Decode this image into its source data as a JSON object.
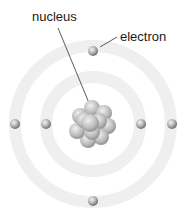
{
  "diagram": {
    "labels": {
      "nucleus": "nucleus",
      "electron": "electron"
    },
    "nucleus": {
      "cx": 93,
      "cy": 124
    },
    "orbits": [
      {
        "name": "inner",
        "radius": 47
      },
      {
        "name": "outer",
        "radius": 78
      }
    ],
    "electrons": [
      {
        "cx": 93,
        "cy": 51
      },
      {
        "cx": 15,
        "cy": 124
      },
      {
        "cx": 46,
        "cy": 124
      },
      {
        "cx": 141,
        "cy": 124
      },
      {
        "cx": 172,
        "cy": 124
      },
      {
        "cx": 93,
        "cy": 201
      }
    ],
    "colors": {
      "orbit": "#eeeeee",
      "sphere_light": "#e8e8e8",
      "sphere_dark": "#7a7a7a",
      "leader_line": "#333333",
      "text": "#1a1a1a"
    }
  }
}
